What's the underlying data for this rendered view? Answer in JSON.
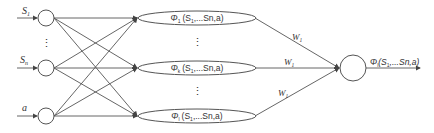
{
  "diagram": {
    "inputs": [
      {
        "label": "S",
        "sub": "1",
        "y": 18
      },
      {
        "label": "S",
        "sub": "n",
        "y": 68
      },
      {
        "label": "a",
        "sub": "",
        "y": 116
      }
    ],
    "input_ellipsis": "⋮",
    "hidden": [
      {
        "phi": "Φ",
        "sub": "1",
        "args": "(S",
        "argsub": "1",
        "rest": ",...Sn,a)",
        "y": 18
      },
      {
        "phi": "Φ",
        "sub": "k",
        "args": "(S",
        "argsub": "1",
        "rest": ",...Sn,a)",
        "y": 68
      },
      {
        "phi": "Φ",
        "sub": "l",
        "args": "(S",
        "argsub": "1",
        "rest": ",...Sn,a)",
        "y": 116
      }
    ],
    "hidden_ellipsis": "⋮",
    "weights": [
      {
        "label": "W",
        "sub": "1"
      },
      {
        "label": "W",
        "sub": "1"
      },
      {
        "label": "W",
        "sub": "1"
      }
    ],
    "output": {
      "phi": "Φ",
      "sub": "l",
      "args": "(S",
      "argsub": "1",
      "rest": ",...Sn,a)"
    },
    "colors": {
      "stroke": "#555555",
      "text": "#333333",
      "background": "#ffffff"
    }
  }
}
